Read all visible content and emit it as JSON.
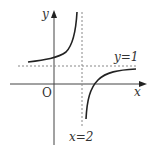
{
  "diagram": {
    "type": "function-graph",
    "axes": {
      "x_label": "x",
      "y_label": "y",
      "origin_label": "O"
    },
    "asymptotes": {
      "vertical": {
        "label": "x=2",
        "value": 2
      },
      "horizontal": {
        "label": "y=1",
        "value": 1
      }
    },
    "colors": {
      "curve": "#222222",
      "axes": "#444444",
      "asymptote": "#888888",
      "text": "#333333",
      "background": "#ffffff"
    }
  }
}
